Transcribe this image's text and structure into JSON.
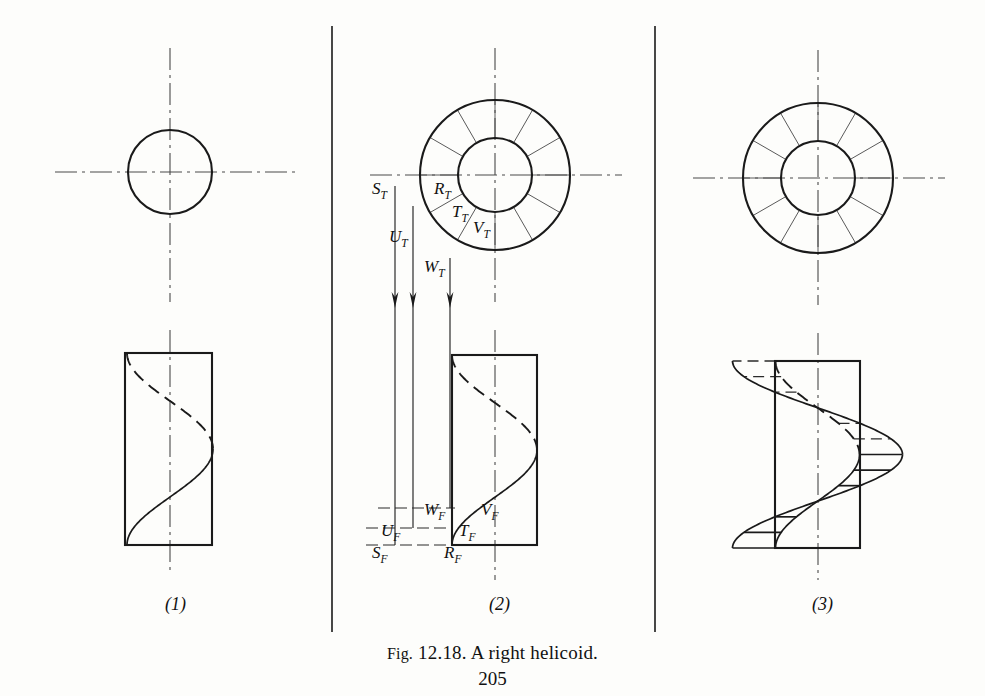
{
  "figure": {
    "caption_prefix": "Fig.",
    "caption_number": "12.18.",
    "caption_text": "A right helicoid.",
    "page_number": "205",
    "caption_full": "Fig. 12.18. A right helicoid."
  },
  "views": [
    {
      "id": "view-1",
      "number_label": "(1)",
      "center_x": 170,
      "label_x": 165,
      "label_y": 610
    },
    {
      "id": "view-2",
      "number_label": "(2)",
      "center_x": 495,
      "label_x": 489,
      "label_y": 610
    },
    {
      "id": "view-3",
      "number_label": "(3)",
      "center_x": 818,
      "label_x": 812,
      "label_y": 610
    }
  ],
  "panel1": {
    "top_view": {
      "circle_cx": 170,
      "circle_cy": 172,
      "circle_r": 42,
      "h_centerline": {
        "x1": 55,
        "x2": 297,
        "y": 172
      },
      "v_centerline": {
        "y1": 48,
        "y2": 302,
        "x": 170
      }
    },
    "front_view": {
      "rect": {
        "x": 125,
        "y": 353,
        "w": 87,
        "h": 192
      },
      "v_centerline": {
        "y1": 330,
        "y2": 572,
        "x": 170
      },
      "helix_pitch_top": 353,
      "helix_pitch_bottom": 545,
      "helix_radius": 43
    }
  },
  "panel2": {
    "top_view": {
      "center_x": 495,
      "center_y": 175,
      "outer_r": 75,
      "inner_r": 37,
      "spoke_count": 12,
      "h_centerline": {
        "x1": 370,
        "x2": 622,
        "y": 175
      },
      "v_centerline": {
        "y1": 48,
        "y2": 302,
        "x": 495
      }
    },
    "front_view": {
      "rect": {
        "x": 452,
        "y": 355,
        "w": 85,
        "h": 190
      },
      "v_centerline": {
        "y1": 330,
        "y2": 580,
        "x": 495
      }
    },
    "top_labels": [
      {
        "text": "S",
        "sub": "T",
        "x": 372,
        "y": 194
      },
      {
        "text": "R",
        "sub": "T",
        "x": 434,
        "y": 194
      },
      {
        "text": "T",
        "sub": "T",
        "x": 452,
        "y": 217
      },
      {
        "text": "V",
        "sub": "T",
        "x": 473,
        "y": 233
      },
      {
        "text": "U",
        "sub": "T",
        "x": 389,
        "y": 242
      },
      {
        "text": "W",
        "sub": "T",
        "x": 424,
        "y": 272
      }
    ],
    "front_labels": [
      {
        "text": "W",
        "sub": "F",
        "x": 424,
        "y": 515
      },
      {
        "text": "V",
        "sub": "F",
        "x": 481,
        "y": 515
      },
      {
        "text": "U",
        "sub": "F",
        "x": 381,
        "y": 536
      },
      {
        "text": "T",
        "sub": "F",
        "x": 459,
        "y": 536
      },
      {
        "text": "S",
        "sub": "F",
        "x": 372,
        "y": 558
      },
      {
        "text": "R",
        "sub": "F",
        "x": 444,
        "y": 558
      }
    ],
    "projectors": [
      {
        "name": "projector-s-u",
        "x": 395,
        "y1": 186,
        "y2": 545,
        "arrow_y": 308
      },
      {
        "name": "projector-u-w",
        "x": 413,
        "y1": 206,
        "y2": 528,
        "arrow_y": 308
      },
      {
        "name": "projector-w-t",
        "x": 450,
        "y1": 258,
        "y2": 508,
        "arrow_y": 308
      }
    ],
    "leaders": [
      {
        "name": "leader-w",
        "x1": 378,
        "x2": 455,
        "y": 508
      },
      {
        "name": "leader-u",
        "x1": 366,
        "x2": 452,
        "y": 528
      },
      {
        "name": "leader-s",
        "x1": 366,
        "x2": 452,
        "y": 545
      }
    ]
  },
  "panel3": {
    "top_view": {
      "center_x": 818,
      "center_y": 178,
      "outer_r": 75,
      "inner_r": 37,
      "spoke_count": 12,
      "h_centerline": {
        "x1": 693,
        "x2": 945,
        "y": 178
      },
      "v_centerline": {
        "y1": 50,
        "y2": 305,
        "x": 818
      }
    },
    "front_view": {
      "rect": {
        "x": 775,
        "y": 361,
        "w": 85,
        "h": 187
      },
      "v_centerline": {
        "y1": 333,
        "y2": 580,
        "x": 818
      },
      "outer_radius": 85,
      "inner_radius": 42,
      "element_line_count": 6
    }
  },
  "dividers": [
    {
      "name": "divider-1-2",
      "x": 332,
      "y1": 26,
      "y2": 632
    },
    {
      "name": "divider-2-3",
      "x": 655,
      "y1": 26,
      "y2": 632
    }
  ],
  "colors": {
    "ink": "#1a1a1a",
    "thin_ink": "#5a5a5a",
    "paper": "#fdfdfb"
  }
}
